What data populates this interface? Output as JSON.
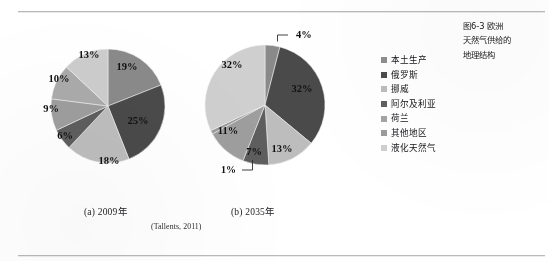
{
  "figure": {
    "title_lines": [
      "图6-3  欧洲",
      "天然气供给的",
      "地理结构"
    ],
    "source_note": "(Tallents, 2011)",
    "subcaption_a": "(a) 2009年",
    "subcaption_b": "(b) 2035年"
  },
  "legend": {
    "items": [
      {
        "label": "本土生产",
        "color": "#8e8e8e"
      },
      {
        "label": "俄罗斯",
        "color": "#4b4b4b"
      },
      {
        "label": "挪威",
        "color": "#bdbdbd"
      },
      {
        "label": "阿尔及利亚",
        "color": "#5f5f5f"
      },
      {
        "label": "荷兰",
        "color": "#a4a4a4"
      },
      {
        "label": "其他地区",
        "color": "#9b9b9b"
      },
      {
        "label": "液化天然气",
        "color": "#cfcfcf"
      }
    ]
  },
  "chart_data": [
    {
      "type": "pie",
      "title": "(a) 2009年",
      "categories": [
        "本土生产",
        "俄罗斯",
        "挪威",
        "阿尔及利亚",
        "荷兰",
        "其他地区",
        "液化天然气"
      ],
      "values": [
        19,
        25,
        18,
        6,
        9,
        10,
        13
      ],
      "labels": [
        "19%",
        "25%",
        "18%",
        "6%",
        "9%",
        "10%",
        "13%"
      ],
      "colors": [
        "#8a8a8a",
        "#4a4a4a",
        "#bdbdbd",
        "#5e5e5e",
        "#9e9e9e",
        "#ababab",
        "#cdcdcd"
      ],
      "start_angle_deg": 0,
      "direction": "clockwise",
      "labels_inside": true,
      "legend_position": "right-shared",
      "grid": false
    },
    {
      "type": "pie",
      "title": "(b) 2035年",
      "categories": [
        "本土生产",
        "俄罗斯",
        "挪威",
        "阿尔及利亚",
        "荷兰",
        "其他地区",
        "液化天然气"
      ],
      "values": [
        4,
        32,
        13,
        7,
        11,
        1,
        32
      ],
      "labels": [
        "4%",
        "32%",
        "13%",
        "7%",
        "11%",
        "1%",
        "32%"
      ],
      "colors": [
        "#8a8a8a",
        "#4a4a4a",
        "#bdbdbd",
        "#5e5e5e",
        "#9e9e9e",
        "#9b9b9b",
        "#cfcfcf"
      ],
      "start_angle_deg": 0,
      "direction": "clockwise",
      "leader_labels": [
        "4%",
        "1%"
      ],
      "legend_position": "right-shared",
      "grid": false
    }
  ]
}
